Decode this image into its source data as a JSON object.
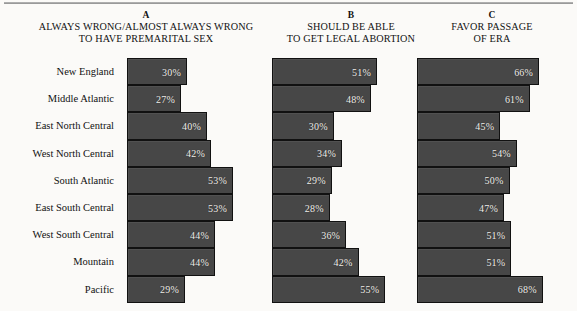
{
  "figure": {
    "background_color": "#fbfaf8",
    "bar_color": "#474747",
    "bar_border_color": "#111111",
    "value_text_color": "#f2f0ec"
  },
  "columns": [
    {
      "letter": "A",
      "caption": "ALWAYS WRONG/ALMOST ALWAYS WRONG\nTO HAVE PREMARITAL SEX"
    },
    {
      "letter": "B",
      "caption": "SHOULD BE ABLE\nTO GET LEGAL ABORTION"
    },
    {
      "letter": "C",
      "caption": "FAVOR PASSAGE\nOF ERA"
    }
  ],
  "regions": [
    "New England",
    "Middle Atlantic",
    "East North Central",
    "West North Central",
    "South Atlantic",
    "East South Central",
    "West South Central",
    "Mountain",
    "Pacific"
  ],
  "values": {
    "A": [
      "30%",
      "27%",
      "40%",
      "42%",
      "53%",
      "53%",
      "44%",
      "44%",
      "29%"
    ],
    "B": [
      "51%",
      "48%",
      "30%",
      "34%",
      "29%",
      "28%",
      "36%",
      "42%",
      "55%"
    ],
    "C": [
      "66%",
      "61%",
      "45%",
      "54%",
      "50%",
      "47%",
      "51%",
      "51%",
      "68%"
    ]
  },
  "chart_data": {
    "type": "bar",
    "title": "",
    "orientation": "horizontal",
    "categories": [
      "New England",
      "Middle Atlantic",
      "East North Central",
      "West North Central",
      "South Atlantic",
      "East South Central",
      "West South Central",
      "Mountain",
      "Pacific"
    ],
    "series": [
      {
        "name": "A",
        "label": "ALWAYS WRONG/ALMOST ALWAYS WRONG TO HAVE PREMARITAL SEX",
        "values": [
          30,
          27,
          40,
          42,
          53,
          53,
          44,
          44,
          29
        ],
        "units": "percent",
        "px_per_unit": 2.0
      },
      {
        "name": "B",
        "label": "SHOULD BE ABLE TO GET LEGAL ABORTION",
        "values": [
          51,
          48,
          30,
          34,
          29,
          28,
          36,
          42,
          55
        ],
        "units": "percent",
        "px_per_unit": 2.06
      },
      {
        "name": "C",
        "label": "FAVOR PASSAGE OF ERA",
        "values": [
          66,
          61,
          45,
          54,
          50,
          47,
          51,
          51,
          68
        ],
        "units": "percent",
        "px_per_unit": 1.85
      }
    ],
    "xlabel": "",
    "ylabel": "",
    "xlim": [
      0,
      70
    ],
    "grid": false,
    "legend": "none",
    "data_labels": true
  }
}
